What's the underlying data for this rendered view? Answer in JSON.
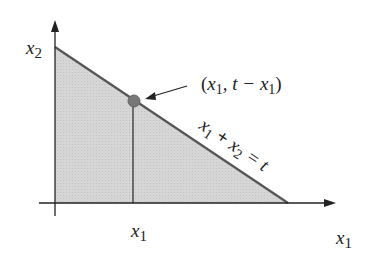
{
  "diagram": {
    "axes": {
      "x_label": "x",
      "x_label_sub": "1",
      "y_label": "x",
      "y_label_sub": "2"
    },
    "tick_label": {
      "main": "x",
      "sub": "1"
    },
    "point_annotation": {
      "open": "(",
      "v1": "x",
      "v1_sub": "1",
      "mid": ", t − ",
      "v2": "x",
      "v2_sub": "1",
      "close": ")"
    },
    "line_label": {
      "a": "x",
      "a_sub": "1",
      "plus": " + ",
      "b": "x",
      "b_sub": "2",
      "eq": " = t"
    },
    "colors": {
      "fill": "#d4d4d4",
      "line": "#555555",
      "point": "#777777",
      "axis": "#222222"
    }
  }
}
